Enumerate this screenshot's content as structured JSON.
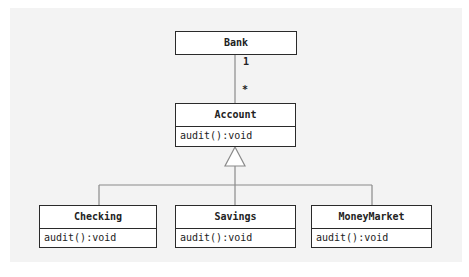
{
  "diagram": {
    "type": "uml-class-diagram",
    "classes": [
      {
        "id": "bank",
        "name": "Bank",
        "operations": []
      },
      {
        "id": "account",
        "name": "Account",
        "operations": [
          "audit():void"
        ]
      },
      {
        "id": "checking",
        "name": "Checking",
        "operations": [
          "audit():void"
        ]
      },
      {
        "id": "savings",
        "name": "Savings",
        "operations": [
          "audit():void"
        ]
      },
      {
        "id": "moneymarket",
        "name": "MoneyMarket",
        "operations": [
          "audit():void"
        ]
      }
    ],
    "association": {
      "from": "Bank",
      "to": "Account",
      "from_multiplicity": "1",
      "to_multiplicity": "*"
    },
    "generalization": {
      "parent": "Account",
      "children": [
        "Checking",
        "Savings",
        "MoneyMarket"
      ]
    },
    "colors": {
      "background_panel": "#f3f3f3",
      "box_fill": "#ffffff",
      "box_border": "#2a2a2a",
      "connector": "#8a8a8a"
    }
  }
}
